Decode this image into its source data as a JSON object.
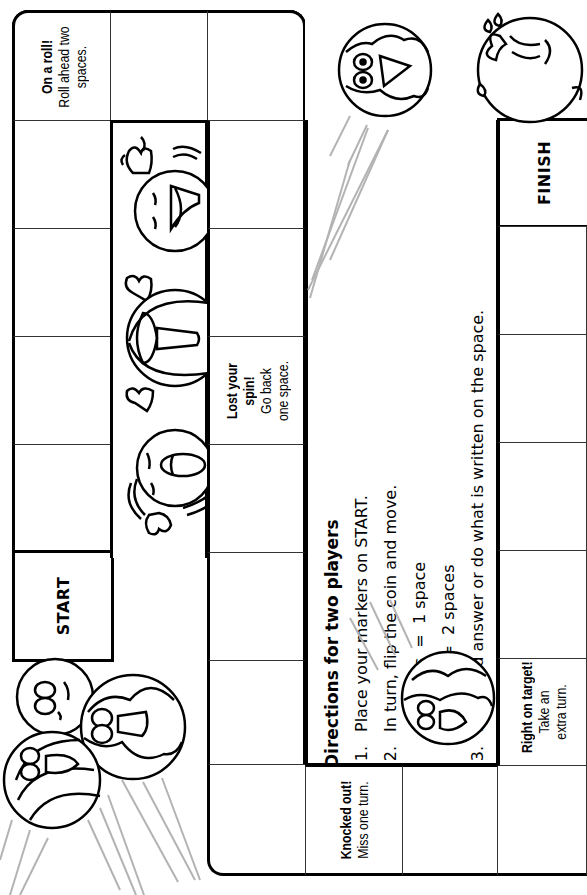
{
  "board": {
    "start_label": "START",
    "finish_label": "FINISH",
    "special_spaces": [
      {
        "id": "on-a-roll",
        "title": "On a roll!",
        "lines": [
          "Roll ahead two",
          "spaces."
        ]
      },
      {
        "id": "lost-your-spin",
        "title": "Lost your",
        "title2": "spin!",
        "lines": [
          "Go back",
          "one space."
        ]
      },
      {
        "id": "knocked-out",
        "title": "Knocked out!",
        "lines": [
          "Miss one turn."
        ]
      },
      {
        "id": "right-on-target",
        "title": "Right on target!",
        "lines": [
          "Take an",
          "extra turn."
        ]
      }
    ]
  },
  "directions": {
    "title": "Directions for two players",
    "steps": [
      {
        "num": "1.",
        "text": "Place your markers on START."
      },
      {
        "num": "2.",
        "text": "In turn, flip the coin and move."
      },
      {
        "num": "",
        "text": "Heads  =  1 space"
      },
      {
        "num": "",
        "text": "Tails   =  2 spaces"
      },
      {
        "num": "3.",
        "text": "Read and answer or do what is written on the space."
      },
      {
        "num": "",
        "text": "If your answer is approved by your partner, you may stay."
      },
      {
        "num": "",
        "text": "If your answer is not approved, return to your original space."
      },
      {
        "num": "4.",
        "text": "The first player to reach FINISH wins."
      }
    ]
  },
  "colors": {
    "line": "#000000",
    "thin_line": "#333333",
    "motion_line": "#b3b3b3",
    "background": "#ffffff"
  }
}
